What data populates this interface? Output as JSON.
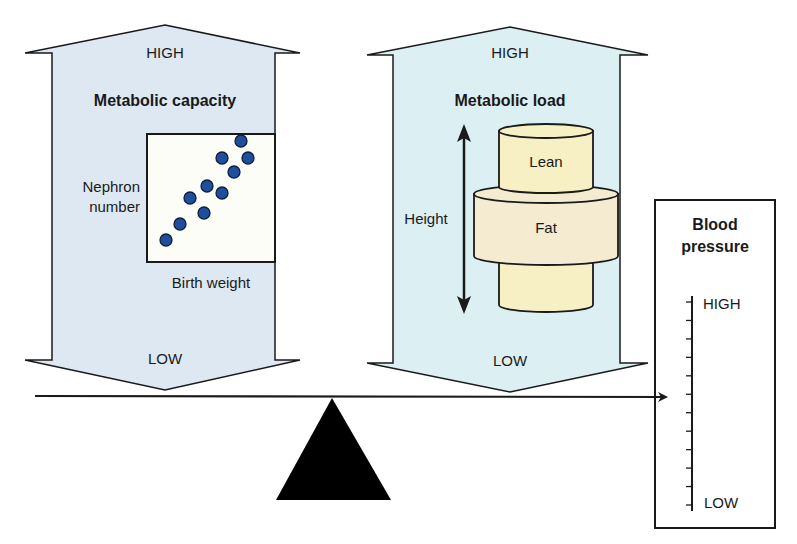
{
  "colors": {
    "capacity_arrow_fill": "#dde8f3",
    "load_arrow_fill": "#dcf0f4",
    "cylinder_lean_fill": "#f7f0c4",
    "cylinder_fat_fill": "#f4ebd0",
    "scatter_dot": "#1f4e9c",
    "outline": "#1a1a1a"
  },
  "capacity_arrow": {
    "top_label": "HIGH",
    "title": "Metabolic capacity",
    "bottom_label": "LOW",
    "plot": {
      "y_label_line1": "Nephron",
      "y_label_line2": "number",
      "x_label": "Birth weight"
    }
  },
  "load_arrow": {
    "top_label": "HIGH",
    "title": "Metabolic load",
    "bottom_label": "LOW",
    "height_label": "Height",
    "lean_label": "Lean",
    "fat_label": "Fat"
  },
  "blood_pressure": {
    "title_line1": "Blood",
    "title_line2": "pressure",
    "high_label": "HIGH",
    "low_label": "LOW",
    "tick_count": 12
  },
  "scatter_points": [
    [
      166,
      240
    ],
    [
      180,
      224
    ],
    [
      190,
      198
    ],
    [
      204,
      213
    ],
    [
      207,
      186
    ],
    [
      222,
      193
    ],
    [
      234,
      172
    ],
    [
      222,
      158
    ],
    [
      248,
      158
    ],
    [
      241,
      141
    ]
  ]
}
